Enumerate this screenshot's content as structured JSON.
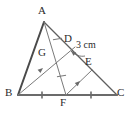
{
  "figure": {
    "kind": "geometry-diagram",
    "background_color": "#ffffff",
    "stroke_colors": {
      "outline": "#5a5a5a",
      "thick_outline": "#4a4a4a",
      "base": "#6b6b6b",
      "inner": "#7a7a7a",
      "label": "#2b2b2b"
    }
  },
  "points": {
    "A": {
      "label": "A",
      "x": 44,
      "y": 22,
      "label_x": 38,
      "label_y": 6
    },
    "B": {
      "label": "B",
      "x": 18,
      "y": 95,
      "label_x": 6,
      "label_y": 88
    },
    "C": {
      "label": "C",
      "x": 117,
      "y": 95,
      "label_x": 118,
      "label_y": 88
    },
    "D": {
      "label": "D",
      "x": 75,
      "y": 47,
      "label_x": 65,
      "label_y": 34
    },
    "E": {
      "label": "E",
      "x": 92,
      "y": 70,
      "label_x": 85,
      "label_y": 57
    },
    "F": {
      "label": "F",
      "x": 66,
      "y": 95,
      "label_x": 61,
      "label_y": 98
    },
    "G": {
      "label": "G",
      "x": 51,
      "y": 57,
      "label_x": 38,
      "label_y": 48
    }
  },
  "segments": [
    {
      "name": "AB",
      "from": "A",
      "to": "B",
      "style": "thick"
    },
    {
      "name": "AC",
      "from": "A",
      "to": "C",
      "style": "thin"
    },
    {
      "name": "BC",
      "from": "B",
      "to": "C",
      "style": "base"
    },
    {
      "name": "AF",
      "from": "A",
      "to": "F",
      "style": "inner"
    },
    {
      "name": "BD",
      "from": "B",
      "to": "D",
      "style": "inner"
    },
    {
      "name": "FE",
      "from": "F",
      "to": "E",
      "style": "inner"
    }
  ],
  "measurements": {
    "DE": {
      "text": "3 cm",
      "x": 77,
      "y": 45,
      "applies_to": "DE"
    }
  },
  "tick_marks": [
    {
      "on": "BF",
      "count": 1
    },
    {
      "on": "FC",
      "count": 1
    },
    {
      "on": "AG",
      "count": 1
    },
    {
      "on": "GF",
      "count": 1
    }
  ],
  "arrow_markers": [
    {
      "on": "BD",
      "direction": "toward-D"
    },
    {
      "on": "FE",
      "direction": "toward-E"
    },
    {
      "on": "leader",
      "direction": "toward-DE"
    }
  ]
}
